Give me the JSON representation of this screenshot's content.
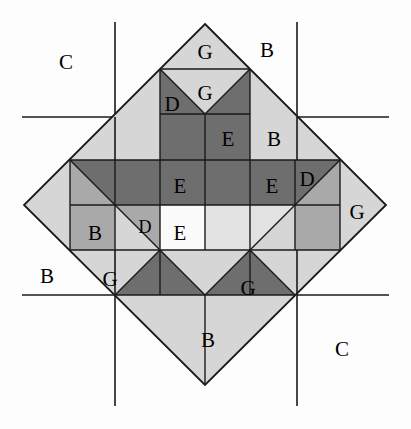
{
  "figure": {
    "type": "geometric-quilt-block-diagram",
    "canvas": {
      "width": 411,
      "height": 429,
      "background": "#fdfdfd"
    },
    "palette": {
      "line": "#1a1a1a",
      "background": "#fdfdfd",
      "dark_gray": "#6e6e6e",
      "medium_gray": "#a9a9a9",
      "light_gray": "#d6d6d6",
      "pale_gray": "#ececec",
      "white": "#fbfbfb"
    },
    "diamond": {
      "top": [
        205,
        24
      ],
      "right": [
        386,
        205
      ],
      "bottom": [
        205,
        385
      ],
      "left": [
        24,
        205
      ],
      "center": [
        205,
        205
      ],
      "cell_size": 45
    },
    "grid_lines": {
      "vertical_x": [
        115,
        297
      ],
      "horizontal_y": [
        117,
        295
      ],
      "frame": {
        "left": 22,
        "top": 22,
        "right": 389,
        "bottom": 406
      }
    },
    "labels": [
      {
        "text": "C",
        "x": 66,
        "y": 62,
        "size": "lg",
        "region": "outer-top-left-corner"
      },
      {
        "text": "B",
        "x": 267,
        "y": 50,
        "size": "lg",
        "region": "outer-top-right"
      },
      {
        "text": "G",
        "x": 205,
        "y": 52,
        "size": "lg",
        "region": "apex-triangle"
      },
      {
        "text": "G",
        "x": 205,
        "y": 93,
        "size": "lg",
        "region": "second-row-center-triangle"
      },
      {
        "text": "D",
        "x": 172,
        "y": 104,
        "size": "lg",
        "region": "second-row-left-dark"
      },
      {
        "text": "E",
        "x": 228,
        "y": 139,
        "size": "lg",
        "region": "third-row-right-dark-square"
      },
      {
        "text": "B",
        "x": 274,
        "y": 139,
        "size": "lg",
        "region": "upper-right-side-triangle"
      },
      {
        "text": "E",
        "x": 180,
        "y": 186,
        "size": "lg",
        "region": "middle-band-left-center"
      },
      {
        "text": "E",
        "x": 272,
        "y": 186,
        "size": "lg",
        "region": "middle-band-right"
      },
      {
        "text": "D",
        "x": 307,
        "y": 179,
        "size": "lg",
        "region": "middle-band-far-right-triangle"
      },
      {
        "text": "G",
        "x": 357,
        "y": 212,
        "size": "lg",
        "region": "right-vertex-triangle"
      },
      {
        "text": "B",
        "x": 95,
        "y": 233,
        "size": "lg",
        "region": "lower-left-medium-region"
      },
      {
        "text": "D",
        "x": 145,
        "y": 227,
        "size": "lg",
        "region": "lower-left-small-triangle"
      },
      {
        "text": "E",
        "x": 180,
        "y": 233,
        "size": "lg",
        "region": "center-white-square"
      },
      {
        "text": "B",
        "x": 47,
        "y": 276,
        "size": "lg",
        "region": "outer-left-middle"
      },
      {
        "text": "G",
        "x": 110,
        "y": 279,
        "size": "lg",
        "region": "lower-left-light-triangle"
      },
      {
        "text": "G",
        "x": 248,
        "y": 288,
        "size": "lg",
        "region": "lower-right-dark-triangle"
      },
      {
        "text": "B",
        "x": 208,
        "y": 340,
        "size": "lg",
        "region": "bottom-vertex-triangle"
      },
      {
        "text": "C",
        "x": 342,
        "y": 349,
        "size": "lg",
        "region": "outer-bottom-right-corner"
      }
    ],
    "legend_keys": [
      "B",
      "C",
      "D",
      "E",
      "G"
    ]
  }
}
